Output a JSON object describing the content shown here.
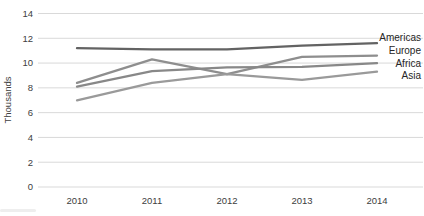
{
  "chart_data": {
    "type": "line",
    "title": "",
    "ylabel": "Thousands",
    "xlabel": "",
    "x": [
      2010,
      2011,
      2012,
      2013,
      2014
    ],
    "xtick_labels": [
      "2010",
      "2011",
      "2012",
      "2013",
      "2014"
    ],
    "ytick_labels": [
      "0",
      "2",
      "4",
      "6",
      "8",
      "10",
      "12",
      "14"
    ],
    "ylim": [
      0,
      14
    ],
    "ytick_step": 2,
    "grid": true,
    "legend_position": "labels-at-line-ends-right",
    "series": [
      {
        "name": "Americas",
        "values": [
          11.2,
          11.1,
          11.1,
          11.4,
          11.6
        ],
        "color": "#636363"
      },
      {
        "name": "Europe",
        "values": [
          8.4,
          10.3,
          9.1,
          10.5,
          10.6
        ],
        "color": "#8e8e8e"
      },
      {
        "name": "Africa",
        "values": [
          8.1,
          9.35,
          9.65,
          9.7,
          10.0
        ],
        "color": "#888888"
      },
      {
        "name": "Asia",
        "values": [
          7.0,
          8.4,
          9.1,
          8.65,
          9.3
        ],
        "color": "#9a9a9a"
      }
    ],
    "axis_text_color": "#404040",
    "series_label_color": "#262626",
    "gridline_color": "#d9d9d9"
  }
}
